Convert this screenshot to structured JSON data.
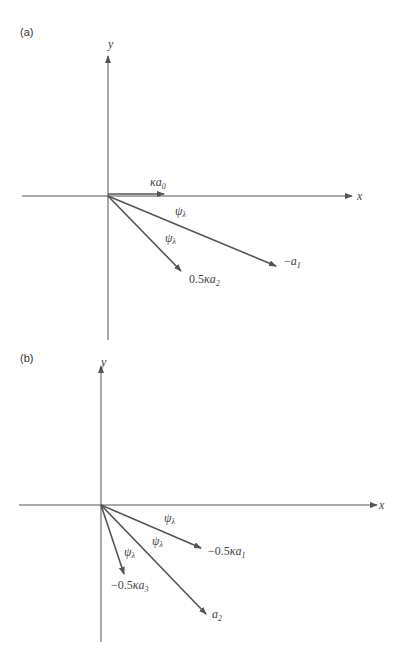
{
  "panels": [
    {
      "label": "(a)",
      "axes": {
        "x_label": "x",
        "y_label": "y"
      },
      "vectors": [
        {
          "name": "ka0",
          "label_prefix": "",
          "symbol": "κa",
          "subscript": "0"
        },
        {
          "name": "neg-a1",
          "label_prefix": "−",
          "symbol": "a",
          "subscript": "1"
        },
        {
          "name": "half-ka2",
          "label_prefix": "0.5",
          "symbol": "κa",
          "subscript": "2"
        }
      ],
      "angle_labels": [
        {
          "symbol": "ψ",
          "subscript": "λ"
        },
        {
          "symbol": "ψ",
          "subscript": "λ"
        }
      ]
    },
    {
      "label": "(b)",
      "axes": {
        "x_label": "x",
        "y_label": "y"
      },
      "vectors": [
        {
          "name": "neg-half-ka1",
          "label_prefix": "−0.5",
          "symbol": "κa",
          "subscript": "1"
        },
        {
          "name": "a2",
          "label_prefix": "",
          "symbol": "a",
          "subscript": "2"
        },
        {
          "name": "neg-half-ka3",
          "label_prefix": "−0.5",
          "symbol": "κa",
          "subscript": "3"
        }
      ],
      "angle_labels": [
        {
          "symbol": "ψ",
          "subscript": "λ"
        },
        {
          "symbol": "ψ",
          "subscript": "λ"
        },
        {
          "symbol": "ψ",
          "subscript": "λ"
        }
      ]
    }
  ],
  "colors": {
    "line": "#555555",
    "text": "#444444",
    "background": "#ffffff"
  }
}
